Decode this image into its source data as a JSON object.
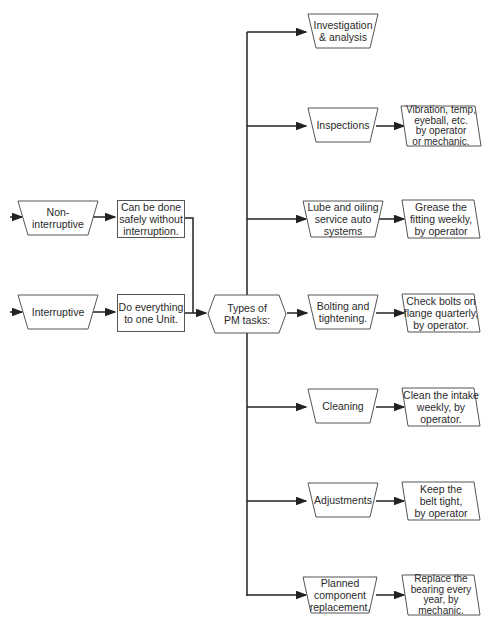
{
  "diagram": {
    "inputs": [
      {
        "label": "Non-\ninterruptive",
        "note": "Can be done\nsafely without\ninterruption."
      },
      {
        "label": "Interruptive",
        "note": "Do everything\nto one Unit."
      }
    ],
    "hub": {
      "label": "Types of\nPM tasks:"
    },
    "tasks": [
      {
        "label": "Investigation\n& analysis",
        "detail": ""
      },
      {
        "label": "Inspections",
        "detail": "Vibration, temp,\neyeball, etc.\nby operator\nor mechanic."
      },
      {
        "label": "Lube and oiling\nservice auto\nsystems",
        "detail": "Grease the\nfitting weekly,\nby operator"
      },
      {
        "label": "Bolting and\ntightening.",
        "detail": "Check bolts on\nflange quarterly,\nby operator."
      },
      {
        "label": "Cleaning",
        "detail": "Clean the intake\nweekly, by\noperator."
      },
      {
        "label": "Adjustments",
        "detail": "Keep the\nbelt tight,\nby operator"
      },
      {
        "label": "Planned\ncomponent\nreplacement.",
        "detail": "Replace the\nbearing every\nyear, by\nmechanic."
      }
    ]
  }
}
